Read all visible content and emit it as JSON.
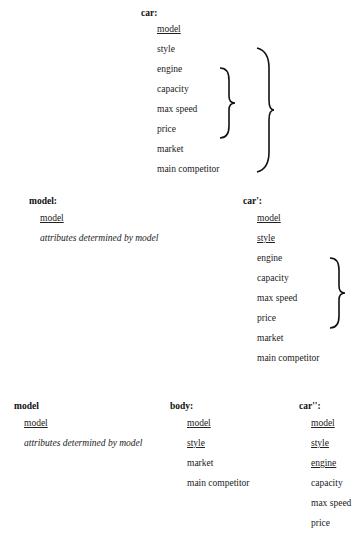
{
  "blocks": {
    "car": {
      "title": "car:",
      "attributes": [
        "model",
        "style",
        "engine",
        "capacity",
        "max speed",
        "price",
        "market",
        "main competitor"
      ],
      "keys": [
        "model"
      ]
    },
    "model1": {
      "title": "model:",
      "attributes": [
        "model",
        "attributes determined by model"
      ],
      "keys": [
        "model"
      ]
    },
    "car_prime": {
      "title": "car':",
      "attributes": [
        "model",
        "style",
        "engine",
        "capacity",
        "max speed",
        "price",
        "market",
        "main competitor"
      ],
      "keys": [
        "model",
        "style"
      ]
    },
    "model2": {
      "title": "model",
      "attributes": [
        "model",
        "attributes determined by model"
      ],
      "keys": [
        "model"
      ]
    },
    "body": {
      "title": "body:",
      "attributes": [
        "model",
        "style",
        "market",
        "main competitor"
      ],
      "keys": [
        "model",
        "style"
      ]
    },
    "car_dprime": {
      "title": "car'':",
      "attributes": [
        "model",
        "style",
        "engine",
        "capacity",
        "max speed",
        "price"
      ],
      "keys": [
        "model",
        "style",
        "engine"
      ]
    }
  }
}
